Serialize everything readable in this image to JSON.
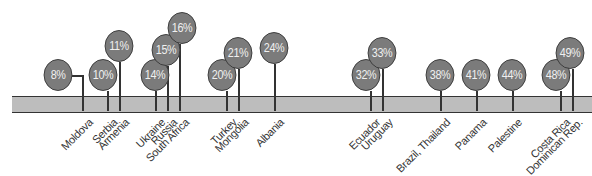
{
  "chart_data": {
    "type": "timeline-bubble",
    "title": "",
    "xlabel": "",
    "ylabel": "",
    "bubble_color": "#7b7b7b",
    "bar_color": "#bdbdbd",
    "points": [
      {
        "label": "Moldova",
        "value": "8%",
        "bx": 58,
        "by": 75,
        "sx": 82,
        "ly": 114,
        "elbow": true
      },
      {
        "label": "Serbia",
        "value": "10%",
        "bx": 103,
        "by": 75,
        "sx": 107,
        "ly": 114
      },
      {
        "label": "Armenia",
        "value": "11%",
        "bx": 119,
        "by": 46,
        "sx": 119,
        "ly": 114
      },
      {
        "label": "Ukraine",
        "value": "14%",
        "bx": 155,
        "by": 75,
        "sx": 155,
        "ly": 114
      },
      {
        "label": "Russia",
        "value": "15%",
        "bx": 166,
        "by": 50,
        "sx": 167,
        "ly": 114
      },
      {
        "label": "South Africa",
        "value": "16%",
        "bx": 182,
        "by": 28,
        "sx": 179,
        "ly": 114
      },
      {
        "label": "Turkey",
        "value": "20%",
        "bx": 222,
        "by": 75,
        "sx": 226,
        "ly": 114
      },
      {
        "label": "Mongolia",
        "value": "21%",
        "bx": 238,
        "by": 53,
        "sx": 238,
        "ly": 114
      },
      {
        "label": "Albania",
        "value": "24%",
        "bx": 274,
        "by": 48,
        "sx": 274,
        "ly": 114
      },
      {
        "label": "Ecuador",
        "value": "32%",
        "bx": 366,
        "by": 75,
        "sx": 370,
        "ly": 114
      },
      {
        "label": "Uruguay",
        "value": "33%",
        "bx": 382,
        "by": 53,
        "sx": 382,
        "ly": 114
      },
      {
        "label": "Brazil, Thailand",
        "value": "38%",
        "bx": 440,
        "by": 75,
        "sx": 440,
        "ly": 114
      },
      {
        "label": "Panama",
        "value": "41%",
        "bx": 476,
        "by": 75,
        "sx": 476,
        "ly": 114
      },
      {
        "label": "Palestine",
        "value": "44%",
        "bx": 512,
        "by": 75,
        "sx": 512,
        "ly": 114
      },
      {
        "label": "Costa Rica",
        "value": "48%",
        "bx": 556,
        "by": 75,
        "sx": 560,
        "ly": 114
      },
      {
        "label": "Dominican Rep.",
        "value": "49%",
        "bx": 570,
        "by": 53,
        "sx": 572,
        "ly": 114
      }
    ],
    "categories": [
      "Moldova",
      "Serbia",
      "Armenia",
      "Ukraine",
      "Russia",
      "South Africa",
      "Turkey",
      "Mongolia",
      "Albania",
      "Ecuador",
      "Uruguay",
      "Brazil, Thailand",
      "Panama",
      "Palestine",
      "Costa Rica",
      "Dominican Rep."
    ],
    "values": [
      8,
      10,
      11,
      14,
      15,
      16,
      20,
      21,
      24,
      32,
      33,
      38,
      41,
      44,
      48,
      49
    ]
  }
}
